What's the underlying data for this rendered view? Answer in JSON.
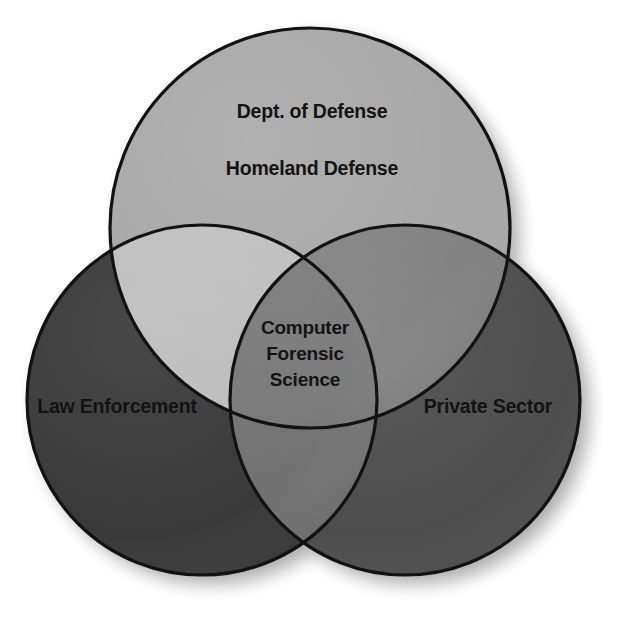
{
  "diagram": {
    "type": "venn-3-circle",
    "background_color": "#ffffff",
    "outline_color": "#121212",
    "text_color": "#131313",
    "sets": [
      {
        "id": "defense",
        "position": "top",
        "labels": [
          "Dept. of Defense",
          "Homeland Defense"
        ],
        "fill_color": "#a8a8a8",
        "center": {
          "x": 310,
          "y": 228
        },
        "radius": 200
      },
      {
        "id": "law-enforcement",
        "position": "left",
        "labels": [
          "Law Enforcement"
        ],
        "fill_color": "#3a3a3a",
        "center": {
          "x": 202,
          "y": 400
        },
        "radius": 175
      },
      {
        "id": "private-sector",
        "position": "right",
        "labels": [
          "Private Sector"
        ],
        "fill_color": "#4e4e4e",
        "center": {
          "x": 405,
          "y": 400
        },
        "radius": 175
      }
    ],
    "intersections": [
      {
        "id": "defense-law",
        "sets": [
          "defense",
          "law-enforcement"
        ],
        "fill_color": "#bdbdbd"
      },
      {
        "id": "defense-private",
        "sets": [
          "defense",
          "private-sector"
        ],
        "fill_color": "#7e7e7e"
      },
      {
        "id": "law-private",
        "sets": [
          "law-enforcement",
          "private-sector"
        ],
        "fill_color": "#707070"
      },
      {
        "id": "center-all",
        "sets": [
          "defense",
          "law-enforcement",
          "private-sector"
        ],
        "fill_color": "#757575",
        "labels": [
          "Computer",
          "Forensic",
          "Science"
        ]
      }
    ],
    "labels": {
      "defense_line1": "Dept. of Defense",
      "defense_line2": "Homeland Defense",
      "law_enforcement": "Law Enforcement",
      "private_sector": "Private Sector",
      "center_line1": "Computer",
      "center_line2": "Forensic",
      "center_line3": "Science"
    }
  }
}
